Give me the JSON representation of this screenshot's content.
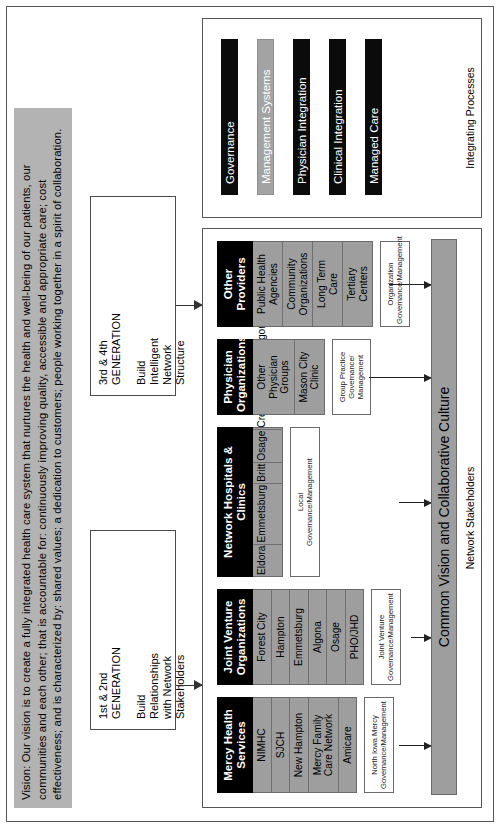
{
  "vision": {
    "text": "Vision: Our vision is to create a fully integrated health care system that nurtures the health and well-being of our patients, our communities and each other; that is accountable for: continuously improving quality, accessible and appropriate care; cost effectiveness; and is characterized by: shared values; a dedication to customers; people working together in a spirit of collaboration."
  },
  "generations": [
    {
      "title": "1st & 2nd\nGENERATION",
      "subtitle": "Build\nRelationships\nwith Network\nStakeholders"
    },
    {
      "title": "3rd & 4th\nGENERATION",
      "subtitle": "Build\nIntelligent\nNetwork\nStructure"
    }
  ],
  "panels": {
    "stakeholders_label": "Network Stakeholders",
    "processes_label": "Integrating Processes"
  },
  "groups": [
    {
      "head": "Mercy Health\nServices",
      "members": [
        "NIMHC",
        "SJCH",
        "New Hampton",
        "Mercy Family\nCare Network",
        "Amicare"
      ],
      "governance": "North Iowa Mercy\nGovernance/Management"
    },
    {
      "head": "Joint Venture\nOrganizations",
      "members": [
        "Forest City",
        "Hampton",
        "Emmetsburg",
        "Algona",
        "Osage",
        "PHO/JHD"
      ],
      "governance": "Joint Venture\nGovernance/Management"
    },
    {
      "head": "Network Hospitals & Clinics",
      "members": [
        "Eldora",
        "Emmetsburg",
        "Britt",
        "Osage",
        "Cresco",
        "Belmond",
        "Algona",
        "Hampton",
        "Iowa Falls"
      ],
      "governance": "Local\nGovernance/Management"
    },
    {
      "head": "Physician\nOrganizations",
      "members": [
        "Other\nPhysician\nGroups",
        "Mason City\nClinic"
      ],
      "governance": "Group Practice\nGovernance/\nManagement"
    },
    {
      "head": "Other Providers",
      "members": [
        "Public Health\nAgencies",
        "Community\nOrganizations",
        "Long Term\nCare",
        "Tertiary\nCenters"
      ],
      "governance": "Organization\nGovernance/Management"
    }
  ],
  "culture_band": {
    "label": "Common Vision and Collaborative Culture"
  },
  "processes": [
    {
      "label": "Governance",
      "style": "dark"
    },
    {
      "label": "Management Systems",
      "style": "gray"
    },
    {
      "label": "Physician Integration",
      "style": "dark"
    },
    {
      "label": "Clinical Integration",
      "style": "dark"
    },
    {
      "label": "Managed Care",
      "style": "dark"
    }
  ],
  "colors": {
    "banner_gray": "#b3b3b3",
    "member_gray": "#9e9e9e",
    "bar_dark": "#0b0b0b",
    "bar_gray": "#a3a3a3"
  }
}
